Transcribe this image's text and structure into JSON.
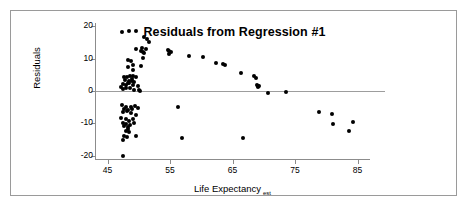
{
  "chart_data": {
    "type": "scatter",
    "title": "Residuals from Regression #1",
    "xlabel": "Life Expectancy",
    "xlabel_subscript": "est",
    "ylabel": "Residuals",
    "xlim": [
      43,
      87
    ],
    "ylim": [
      -21,
      21
    ],
    "xticks": [
      45,
      55,
      65,
      75,
      85
    ],
    "yticks": [
      20,
      10,
      0,
      -10,
      -20
    ],
    "grid": false,
    "legend": false,
    "reference_line_y": 0,
    "marker_color": "#000000",
    "axis_color": "#8c8c8c",
    "points": [
      [
        47.3,
        18.3
      ],
      [
        48.4,
        18.4
      ],
      [
        49.5,
        18.6
      ],
      [
        50.8,
        16.7
      ],
      [
        51.3,
        16.0
      ],
      [
        51.6,
        15.1
      ],
      [
        49.6,
        13.1
      ],
      [
        50.5,
        13.3
      ],
      [
        51.2,
        12.9
      ],
      [
        50.3,
        12.3
      ],
      [
        50.6,
        12.0
      ],
      [
        50.8,
        11.6
      ],
      [
        54.6,
        12.8
      ],
      [
        54.9,
        12.3
      ],
      [
        55.1,
        11.9
      ],
      [
        54.8,
        11.4
      ],
      [
        48.2,
        9.6
      ],
      [
        48.8,
        9.3
      ],
      [
        49.0,
        8.1
      ],
      [
        50.6,
        10.3
      ],
      [
        50.4,
        7.8
      ],
      [
        48.3,
        7.5
      ],
      [
        49.0,
        6.6
      ],
      [
        58.1,
        10.7
      ],
      [
        60.3,
        10.6
      ],
      [
        62.4,
        8.6
      ],
      [
        63.5,
        8.4
      ],
      [
        63.8,
        8.1
      ],
      [
        66.4,
        5.6
      ],
      [
        68.4,
        4.6
      ],
      [
        68.7,
        4.0
      ],
      [
        68.9,
        1.8
      ],
      [
        69.1,
        1.6
      ],
      [
        69.0,
        1.2
      ],
      [
        69.3,
        1.5
      ],
      [
        47.6,
        4.3
      ],
      [
        48.1,
        4.4
      ],
      [
        48.6,
        4.7
      ],
      [
        49.1,
        4.6
      ],
      [
        49.6,
        4.3
      ],
      [
        47.8,
        3.3
      ],
      [
        48.4,
        3.2
      ],
      [
        48.9,
        3.0
      ],
      [
        49.3,
        2.7
      ],
      [
        47.5,
        2.2
      ],
      [
        48.0,
        2.0
      ],
      [
        48.5,
        2.4
      ],
      [
        49.0,
        1.8
      ],
      [
        49.8,
        1.4
      ],
      [
        47.2,
        1.1
      ],
      [
        47.9,
        0.9
      ],
      [
        48.6,
        1.0
      ],
      [
        49.2,
        0.4
      ],
      [
        50.0,
        0.2
      ],
      [
        47.4,
        0.5
      ],
      [
        48.2,
        2.6
      ],
      [
        48.9,
        3.8
      ],
      [
        50.2,
        0.1
      ],
      [
        70.6,
        -0.5
      ],
      [
        73.5,
        -0.3
      ],
      [
        47.3,
        -4.4
      ],
      [
        48.0,
        -4.8
      ],
      [
        48.7,
        -5.0
      ],
      [
        49.4,
        -4.6
      ],
      [
        47.6,
        -5.6
      ],
      [
        48.3,
        -5.8
      ],
      [
        48.9,
        -5.5
      ],
      [
        49.9,
        -5.4
      ],
      [
        47.5,
        -6.4
      ],
      [
        48.1,
        -6.2
      ],
      [
        48.8,
        -6.8
      ],
      [
        49.6,
        -7.3
      ],
      [
        56.2,
        -5.0
      ],
      [
        47.2,
        -8.4
      ],
      [
        47.9,
        -8.8
      ],
      [
        48.5,
        -9.2
      ],
      [
        49.1,
        -8.6
      ],
      [
        47.4,
        -9.8
      ],
      [
        48.0,
        -10.1
      ],
      [
        48.6,
        -10.4
      ],
      [
        49.2,
        -9.9
      ],
      [
        47.7,
        -10.8
      ],
      [
        48.3,
        -11.2
      ],
      [
        48.2,
        -11.8
      ],
      [
        47.9,
        -12.4
      ],
      [
        48.5,
        -12.6
      ],
      [
        47.6,
        -13.8
      ],
      [
        48.1,
        -14.2
      ],
      [
        47.5,
        -15.0
      ],
      [
        49.6,
        -13.9
      ],
      [
        56.9,
        -14.5
      ],
      [
        66.7,
        -14.6
      ],
      [
        47.4,
        -20.0
      ],
      [
        78.9,
        -6.6
      ],
      [
        80.9,
        -7.0
      ],
      [
        81.0,
        -10.2
      ],
      [
        84.2,
        -9.5
      ],
      [
        83.6,
        -12.4
      ]
    ]
  }
}
